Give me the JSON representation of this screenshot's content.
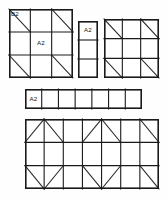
{
  "drawing": {
    "title": "Formwork panel layout",
    "stroke_color": "#1a1a1a",
    "background_color": "#fefefe",
    "diagonal_color": "#2b2b2b",
    "outer_stroke_width": 1.6,
    "inner_stroke_width": 1.1,
    "diagonal_stroke_width": 1.1
  },
  "panels": [
    {
      "id": "panel-top-left",
      "name": "top-left-panel",
      "x": 9,
      "y": 9,
      "width": 64,
      "height": 69,
      "cols": 3,
      "rows": 3,
      "diagonals": [
        {
          "row": 0,
          "col": 0,
          "dir": "tl-br"
        },
        {
          "row": 0,
          "col": 2,
          "dir": "tl-br"
        },
        {
          "row": 2,
          "col": 0,
          "dir": "tl-br"
        },
        {
          "row": 2,
          "col": 2,
          "dir": "tl-br"
        }
      ],
      "labels": [
        {
          "row": 0,
          "col": 0,
          "text": "B2",
          "align": "top-left"
        },
        {
          "row": 1,
          "col": 1,
          "text": "A2",
          "align": "center"
        }
      ]
    },
    {
      "id": "panel-mid-column",
      "name": "middle-column-panel",
      "x": 78,
      "y": 21,
      "width": 20,
      "height": 57,
      "cols": 1,
      "rows": 3,
      "diagonals": [],
      "labels": [
        {
          "row": 0,
          "col": 0,
          "text": "A2",
          "align": "center"
        }
      ]
    },
    {
      "id": "panel-top-right",
      "name": "top-right-panel",
      "x": 104,
      "y": 19,
      "width": 55,
      "height": 59,
      "cols": 3,
      "rows": 3,
      "diagonals": [
        {
          "row": 0,
          "col": 0,
          "dir": "tl-br"
        },
        {
          "row": 0,
          "col": 2,
          "dir": "tl-br"
        },
        {
          "row": 2,
          "col": 0,
          "dir": "tl-br"
        },
        {
          "row": 2,
          "col": 2,
          "dir": "tl-br"
        }
      ],
      "labels": []
    },
    {
      "id": "panel-strip",
      "name": "horizontal-strip-panel",
      "x": 25,
      "y": 89,
      "width": 117,
      "height": 20,
      "cols": 7,
      "rows": 1,
      "diagonals": [],
      "labels": [
        {
          "row": 0,
          "col": 0,
          "text": "A2",
          "align": "center"
        }
      ]
    },
    {
      "id": "panel-bottom",
      "name": "bottom-large-panel",
      "x": 25,
      "y": 119,
      "width": 134,
      "height": 70,
      "cols": 7,
      "rows": 3,
      "diagonals": [
        {
          "row": 0,
          "col": 0,
          "dir": "bl-tr"
        },
        {
          "row": 0,
          "col": 1,
          "dir": "tl-br"
        },
        {
          "row": 0,
          "col": 3,
          "dir": "bl-tr"
        },
        {
          "row": 0,
          "col": 4,
          "dir": "tl-br"
        },
        {
          "row": 0,
          "col": 6,
          "dir": "tl-br"
        },
        {
          "row": 2,
          "col": 0,
          "dir": "tl-br"
        },
        {
          "row": 2,
          "col": 1,
          "dir": "bl-tr"
        },
        {
          "row": 2,
          "col": 3,
          "dir": "tl-br"
        },
        {
          "row": 2,
          "col": 4,
          "dir": "bl-tr"
        },
        {
          "row": 2,
          "col": 6,
          "dir": "tl-br"
        }
      ],
      "labels": []
    }
  ],
  "labels_legend": {
    "b2": "B2",
    "a2": "A2"
  }
}
